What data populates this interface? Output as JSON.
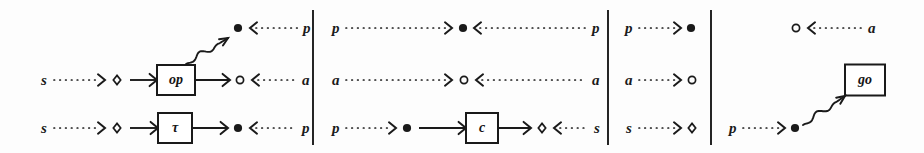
{
  "figure": {
    "name": "process-port-diagram",
    "background_color": "#fdfdfd",
    "ink_color": "#1a1a1a",
    "width": 924,
    "height": 153,
    "panel_count": 4,
    "divider_positions": [
      313,
      608,
      711
    ],
    "row_y": [
      28,
      80,
      128
    ],
    "legend": {
      "filled_circle": "promise-port",
      "open_circle": "argument-port",
      "diamond": "session-port",
      "dotted_arrow": "data-flow",
      "solid_arrow": "control-flow",
      "squiggly_arrow": "spawn-flow"
    }
  },
  "panels": [
    {
      "id": "panel-1",
      "name": "op-tau-panel",
      "rows": [
        {
          "id": "p1r1",
          "y": 28,
          "items": [
            {
              "kind": "node",
              "shape": "filled-circle",
              "x": 238
            },
            {
              "kind": "arrow",
              "style": "dotted",
              "dir": "left",
              "x1": 298,
              "x2": 250
            },
            {
              "kind": "label",
              "text": "p",
              "x": 307
            }
          ]
        },
        {
          "id": "p1r2",
          "y": 80,
          "items": [
            {
              "kind": "label",
              "text": "s",
              "x": 44
            },
            {
              "kind": "arrow",
              "style": "dotted",
              "dir": "right",
              "x1": 54,
              "x2": 105
            },
            {
              "kind": "node",
              "shape": "diamond",
              "x": 117
            },
            {
              "kind": "arrow",
              "style": "solid",
              "dir": "right",
              "x1": 130,
              "x2": 157
            },
            {
              "kind": "box",
              "text": "op",
              "x": 157,
              "w": 38,
              "h": 30
            },
            {
              "kind": "arrow",
              "style": "solid",
              "dir": "right",
              "x1": 195,
              "x2": 230
            },
            {
              "kind": "node",
              "shape": "open-circle",
              "x": 240
            },
            {
              "kind": "arrow",
              "style": "dotted",
              "dir": "left",
              "x1": 298,
              "x2": 252
            },
            {
              "kind": "label",
              "text": "a",
              "x": 306
            }
          ]
        },
        {
          "id": "p1r3",
          "y": 128,
          "items": [
            {
              "kind": "label",
              "text": "s",
              "x": 44
            },
            {
              "kind": "arrow",
              "style": "dotted",
              "dir": "right",
              "x1": 54,
              "x2": 105
            },
            {
              "kind": "node",
              "shape": "diamond",
              "x": 117
            },
            {
              "kind": "arrow",
              "style": "solid",
              "dir": "right",
              "x1": 130,
              "x2": 158
            },
            {
              "kind": "box",
              "text": "τ",
              "x": 158,
              "w": 34,
              "h": 30
            },
            {
              "kind": "arrow",
              "style": "solid",
              "dir": "right",
              "x1": 192,
              "x2": 228
            },
            {
              "kind": "node",
              "shape": "filled-circle",
              "x": 238
            },
            {
              "kind": "arrow",
              "style": "dotted",
              "dir": "left",
              "x1": 296,
              "x2": 250
            },
            {
              "kind": "label",
              "text": "p",
              "x": 306
            }
          ]
        }
      ],
      "squiggly": {
        "name": "op-spawn-arrow",
        "from_x": 186,
        "from_y": 64,
        "to_x": 228,
        "to_y": 38
      }
    },
    {
      "id": "panel-2",
      "name": "c-channel-panel",
      "rows": [
        {
          "id": "p2r1",
          "y": 28,
          "items": [
            {
              "kind": "label",
              "text": "p",
              "x": 336
            },
            {
              "kind": "arrow",
              "style": "dotted",
              "dir": "right",
              "x1": 346,
              "x2": 452
            },
            {
              "kind": "node",
              "shape": "filled-circle",
              "x": 463
            },
            {
              "kind": "arrow",
              "style": "dotted",
              "dir": "left",
              "x1": 586,
              "x2": 474
            },
            {
              "kind": "label",
              "text": "p",
              "x": 596
            }
          ]
        },
        {
          "id": "p2r2",
          "y": 80,
          "items": [
            {
              "kind": "label",
              "text": "a",
              "x": 336
            },
            {
              "kind": "arrow",
              "style": "dotted",
              "dir": "right",
              "x1": 346,
              "x2": 452
            },
            {
              "kind": "node",
              "shape": "open-circle",
              "x": 464
            },
            {
              "kind": "arrow",
              "style": "dotted",
              "dir": "left",
              "x1": 586,
              "x2": 476
            },
            {
              "kind": "label",
              "text": "a",
              "x": 596
            }
          ]
        },
        {
          "id": "p2r3",
          "y": 128,
          "items": [
            {
              "kind": "label",
              "text": "p",
              "x": 336
            },
            {
              "kind": "arrow",
              "style": "dotted",
              "dir": "right",
              "x1": 346,
              "x2": 396
            },
            {
              "kind": "node",
              "shape": "filled-circle",
              "x": 407
            },
            {
              "kind": "arrow",
              "style": "solid",
              "dir": "right",
              "x1": 419,
              "x2": 466
            },
            {
              "kind": "box",
              "text": "c",
              "x": 466,
              "w": 32,
              "h": 30
            },
            {
              "kind": "arrow",
              "style": "solid",
              "dir": "right",
              "x1": 498,
              "x2": 531
            },
            {
              "kind": "node",
              "shape": "diamond",
              "x": 542
            },
            {
              "kind": "arrow",
              "style": "dotted",
              "dir": "left",
              "x1": 588,
              "x2": 554
            },
            {
              "kind": "label",
              "text": "s",
              "x": 597
            }
          ]
        }
      ],
      "squiggly": null
    },
    {
      "id": "panel-3",
      "name": "source-ports-panel",
      "rows": [
        {
          "id": "p3r1",
          "y": 28,
          "items": [
            {
              "kind": "label",
              "text": "p",
              "x": 629
            },
            {
              "kind": "arrow",
              "style": "dotted",
              "dir": "right",
              "x1": 639,
              "x2": 681
            },
            {
              "kind": "node",
              "shape": "filled-circle",
              "x": 691
            }
          ]
        },
        {
          "id": "p3r2",
          "y": 80,
          "items": [
            {
              "kind": "label",
              "text": "a",
              "x": 629
            },
            {
              "kind": "arrow",
              "style": "dotted",
              "dir": "right",
              "x1": 639,
              "x2": 681
            },
            {
              "kind": "node",
              "shape": "open-circle",
              "x": 692
            }
          ]
        },
        {
          "id": "p3r3",
          "y": 128,
          "items": [
            {
              "kind": "label",
              "text": "s",
              "x": 629
            },
            {
              "kind": "arrow",
              "style": "dotted",
              "dir": "right",
              "x1": 639,
              "x2": 681
            },
            {
              "kind": "node",
              "shape": "diamond",
              "x": 692
            }
          ]
        }
      ],
      "squiggly": null
    },
    {
      "id": "panel-4",
      "name": "go-spawn-panel",
      "rows": [
        {
          "id": "p4r1",
          "y": 28,
          "items": [
            {
              "kind": "node",
              "shape": "open-circle",
              "x": 796
            },
            {
              "kind": "arrow",
              "style": "dotted",
              "dir": "left",
              "x1": 862,
              "x2": 808
            },
            {
              "kind": "label",
              "text": "a",
              "x": 872
            }
          ]
        },
        {
          "id": "p4r2",
          "y": 80,
          "items": [
            {
              "kind": "box",
              "text": "go",
              "x": 845,
              "w": 40,
              "h": 31
            }
          ]
        },
        {
          "id": "p4r3",
          "y": 128,
          "items": [
            {
              "kind": "label",
              "text": "p",
              "x": 733
            },
            {
              "kind": "arrow",
              "style": "dotted",
              "dir": "right",
              "x1": 743,
              "x2": 785
            },
            {
              "kind": "node",
              "shape": "filled-circle",
              "x": 795
            }
          ]
        }
      ],
      "squiggly": {
        "name": "go-spawn-arrow",
        "from_x": 803,
        "from_y": 125,
        "to_x": 845,
        "to_y": 96
      }
    }
  ]
}
